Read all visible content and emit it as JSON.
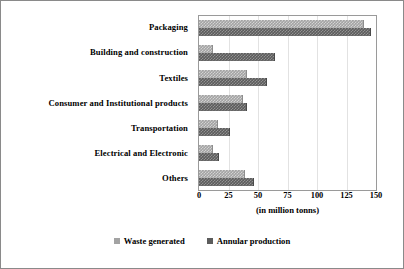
{
  "chart_data": {
    "type": "bar",
    "orientation": "horizontal",
    "title": "",
    "xlabel": "(in million tonns)",
    "ylabel": "",
    "xlim": [
      0,
      150
    ],
    "xticks": [
      0,
      25,
      50,
      75,
      100,
      125,
      150
    ],
    "xtick_labels": [
      "0",
      "25",
      "50",
      "75",
      "100",
      "125",
      "150"
    ],
    "grid": true,
    "grid_axis": "x",
    "legend_position": "bottom",
    "categories": [
      "Packaging",
      "Building and construction",
      "Textiles",
      "Consumer and Institutional products",
      "Transportation",
      "Electrical and Electronic",
      "Others"
    ],
    "series": [
      {
        "name": "Waste generated",
        "color": "#a3a3a3",
        "values": [
          140,
          12,
          41,
          37,
          16,
          12,
          39
        ]
      },
      {
        "name": "Annular production",
        "color": "#5c5c5c",
        "values": [
          146,
          64,
          58,
          41,
          26,
          17,
          47
        ]
      }
    ]
  },
  "legend": {
    "items": [
      {
        "label": "Waste generated",
        "swatch": "legend-swatch-waste"
      },
      {
        "label": "Annular production",
        "swatch": "legend-swatch-production"
      }
    ]
  }
}
